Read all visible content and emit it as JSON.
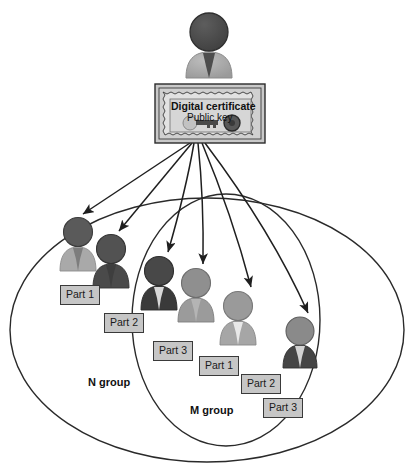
{
  "diagram": {
    "title_present": false,
    "background": "#ffffff",
    "certificate": {
      "title": "Digital certificate",
      "subtitle": "Public key",
      "key_icon_name": "key-icon",
      "box_fill": "#c9c9c9",
      "inner_fill": "#d9d9d9",
      "border": "#2b2b2b"
    },
    "issuer": {
      "icon_name": "person-icon-issuer",
      "head_color": "#4a4a4a",
      "body_color": "#a8a8a8",
      "tie_color": "#4a4a4a"
    },
    "groups": [
      {
        "id": "n-group",
        "label": "N group",
        "label_x": 88,
        "label_y": 376
      },
      {
        "id": "m-group",
        "label": "M group",
        "label_x": 190,
        "label_y": 404
      }
    ],
    "participants": [
      {
        "id": "n-part-1",
        "label": "Part 1",
        "group": "N group",
        "head_color": "#575757",
        "body_color": "#a9a9a9",
        "tie_color": "#7d7d7d",
        "fx": 78,
        "fy": 225,
        "fs": 46,
        "lx": 60,
        "ly": 285
      },
      {
        "id": "n-part-2",
        "label": "Part 2",
        "group": "N group",
        "head_color": "#4f4f4f",
        "body_color": "#4a4a4a",
        "tie_color": "#4a4a4a",
        "fx": 111,
        "fy": 241,
        "fs": 46,
        "lx": 104,
        "ly": 313
      },
      {
        "id": "m-part-3",
        "label": "Part 3",
        "group": "M group",
        "head_color": "#484848",
        "body_color": "#3a3a3a",
        "tie_color": "#d8d8d8",
        "fx": 159,
        "fy": 263,
        "fs": 46,
        "lx": 153,
        "ly": 341
      },
      {
        "id": "m-part-1",
        "label": "Part 1",
        "group": "M group",
        "head_color": "#8f8f8f",
        "body_color": "#9b9b9b",
        "tie_color": "#b4b4b4",
        "fx": 196,
        "fy": 275,
        "fs": 46,
        "lx": 199,
        "ly": 356
      },
      {
        "id": "m-part-2",
        "label": "Part 2",
        "group": "M group",
        "head_color": "#9a9a9a",
        "body_color": "#a6a6a6",
        "tie_color": "#e2e2e2",
        "fx": 238,
        "fy": 298,
        "fs": 46,
        "lx": 241,
        "ly": 374
      },
      {
        "id": "n-part-3",
        "label": "Part 3",
        "group": "N group",
        "head_color": "#8a8a8a",
        "body_color": "#454545",
        "tie_color": "#d2d2d2",
        "fx": 300,
        "fy": 323,
        "fs": 44,
        "lx": 263,
        "ly": 398
      }
    ],
    "arrows": {
      "origin_x": 190,
      "origin_y": 143,
      "count": 6,
      "color": "#1f1f1f"
    }
  }
}
